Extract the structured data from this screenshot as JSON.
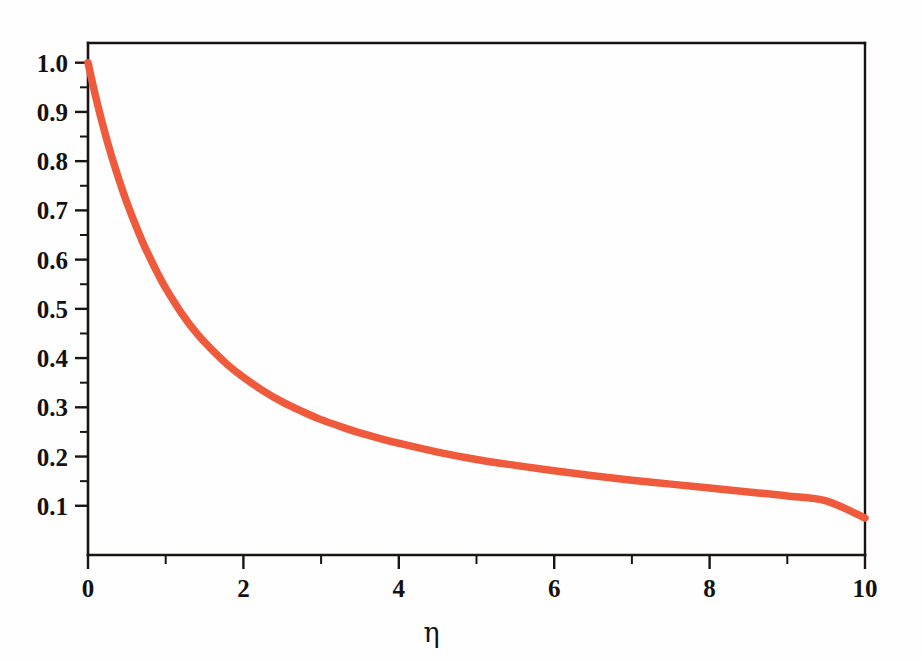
{
  "figure": {
    "background_color": "#fefefe",
    "axis_color": "#1a1513",
    "curve_color": "#ef5a3c"
  },
  "chart_data": {
    "type": "line",
    "title": "",
    "subtitle": "",
    "xlabel": "η",
    "ylabel": "",
    "xlim": [
      0,
      10
    ],
    "ylim": [
      0,
      1.04
    ],
    "grid": false,
    "legend": null,
    "x_ticks_major": [
      0,
      2,
      4,
      6,
      8,
      10
    ],
    "x_tick_labels": [
      "0",
      "2",
      "4",
      "6",
      "8",
      "10"
    ],
    "x_ticks_minor": [
      1,
      3,
      5,
      7,
      9
    ],
    "y_ticks_major": [
      0.1,
      0.2,
      0.3,
      0.4,
      0.5,
      0.6,
      0.7,
      0.8,
      0.9,
      1.0
    ],
    "y_tick_labels": [
      "0.1",
      "0.2",
      "0.3",
      "0.4",
      "0.5",
      "0.6",
      "0.7",
      "0.8",
      "0.9",
      "1.0"
    ],
    "y_ticks_minor": [
      0.15,
      0.25,
      0.35,
      0.45,
      0.55,
      0.65,
      0.75,
      0.85,
      0.95
    ],
    "series": [
      {
        "name": "decay-curve",
        "color": "#ef5a3c",
        "line_width": 7.5,
        "x": [
          0.0,
          0.1,
          0.2,
          0.3,
          0.4,
          0.5,
          0.6,
          0.7,
          0.8,
          0.9,
          1.0,
          1.2,
          1.4,
          1.6,
          1.8,
          2.0,
          2.25,
          2.5,
          2.75,
          3.0,
          3.25,
          3.5,
          3.75,
          4.0,
          4.5,
          5.0,
          5.5,
          6.0,
          6.5,
          7.0,
          7.5,
          8.0,
          8.5,
          9.0,
          9.5,
          10.0
        ],
        "y": [
          1.0,
          0.93,
          0.868,
          0.812,
          0.762,
          0.716,
          0.675,
          0.637,
          0.603,
          0.571,
          0.542,
          0.492,
          0.45,
          0.416,
          0.386,
          0.361,
          0.334,
          0.311,
          0.292,
          0.275,
          0.261,
          0.248,
          0.237,
          0.227,
          0.209,
          0.194,
          0.182,
          0.171,
          0.161,
          0.152,
          0.144,
          0.136,
          0.128,
          0.12,
          0.11,
          0.075
        ]
      }
    ],
    "annotations": []
  },
  "axis_titles": {
    "x": "η"
  }
}
